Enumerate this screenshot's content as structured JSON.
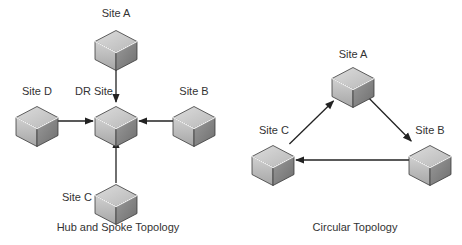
{
  "diagrams": [
    {
      "id": "hub",
      "caption": "Hub and Spoke Topology",
      "nodes": [
        {
          "id": "a",
          "label": "Site A"
        },
        {
          "id": "dr",
          "label": "DR Site"
        },
        {
          "id": "d",
          "label": "Site D"
        },
        {
          "id": "b",
          "label": "Site B"
        },
        {
          "id": "c",
          "label": "Site C"
        }
      ],
      "edges": [
        {
          "from": "a",
          "to": "dr"
        },
        {
          "from": "d",
          "to": "dr"
        },
        {
          "from": "b",
          "to": "dr"
        },
        {
          "from": "c",
          "to": "dr"
        }
      ]
    },
    {
      "id": "circ",
      "caption": "Circular Topology",
      "nodes": [
        {
          "id": "a",
          "label": "Site A"
        },
        {
          "id": "b",
          "label": "Site B"
        },
        {
          "id": "c",
          "label": "Site C"
        }
      ],
      "edges": [
        {
          "from": "a",
          "to": "b"
        },
        {
          "from": "b",
          "to": "c"
        },
        {
          "from": "c",
          "to": "a"
        }
      ]
    }
  ],
  "colors": {
    "cube_top": "#c8c8c8",
    "cube_left": "#b4b4b4",
    "cube_right": "#8a8a8a",
    "cube_edge": "#3a3a3a",
    "line": "#222222",
    "text": "#333333"
  }
}
